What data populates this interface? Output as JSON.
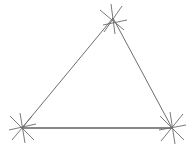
{
  "figure": {
    "type": "geometry-diagram",
    "shape_name": "triangle",
    "width": 196,
    "height": 152,
    "background_color": "#ffffff",
    "colors": {
      "edge_stroke": "#6e6e6e",
      "base_edge_stroke": "#5f5f5f",
      "tick_stroke": "#6a6a6a",
      "background": "#ffffff"
    },
    "stroke_widths": {
      "edge": 1.0,
      "base_edge": 1.5,
      "tick": 0.9
    },
    "vertices": [
      {
        "name": "apex",
        "label": "top-vertex",
        "x": 113,
        "y": 18
      },
      {
        "name": "bottom-left",
        "label": "bottom-left-vertex",
        "x": 22,
        "y": 128
      },
      {
        "name": "bottom-right",
        "label": "bottom-right-vertex",
        "x": 172,
        "y": 128
      }
    ],
    "edges": [
      {
        "name": "left-edge",
        "from": "bottom-left",
        "to": "apex",
        "x1": 22,
        "y1": 128,
        "x2": 113,
        "y2": 18,
        "stroke": "#6e6e6e",
        "width": 1.0
      },
      {
        "name": "right-edge",
        "from": "apex",
        "to": "bottom-right",
        "x1": 113,
        "y1": 18,
        "x2": 172,
        "y2": 128,
        "stroke": "#6e6e6e",
        "width": 1.0
      },
      {
        "name": "base-edge",
        "from": "bottom-left",
        "to": "bottom-right",
        "x1": 22,
        "y1": 128,
        "x2": 172,
        "y2": 128,
        "stroke": "#5f5f5f",
        "width": 1.5
      }
    ],
    "vertex_marks": {
      "apex": [
        {
          "name": "apex-tick-1",
          "x1": 100,
          "y1": 10,
          "x2": 124,
          "y2": 30
        },
        {
          "name": "apex-tick-2",
          "x1": 122,
          "y1": 6,
          "x2": 104,
          "y2": 32
        },
        {
          "name": "apex-tick-3",
          "x1": 103,
          "y1": 25,
          "x2": 127,
          "y2": 20
        },
        {
          "name": "apex-tick-4",
          "x1": 111,
          "y1": 4,
          "x2": 115,
          "y2": 34
        }
      ],
      "bottom-left": [
        {
          "name": "bl-tick-1",
          "x1": 10,
          "y1": 116,
          "x2": 34,
          "y2": 140
        },
        {
          "name": "bl-tick-2",
          "x1": 32,
          "y1": 116,
          "x2": 12,
          "y2": 140
        },
        {
          "name": "bl-tick-3",
          "x1": 9,
          "y1": 130,
          "x2": 36,
          "y2": 124
        },
        {
          "name": "bl-tick-4",
          "x1": 20,
          "y1": 113,
          "x2": 25,
          "y2": 143
        }
      ],
      "bottom-right": [
        {
          "name": "br-tick-1",
          "x1": 160,
          "y1": 116,
          "x2": 184,
          "y2": 140
        },
        {
          "name": "br-tick-2",
          "x1": 183,
          "y1": 114,
          "x2": 161,
          "y2": 141
        },
        {
          "name": "br-tick-3",
          "x1": 159,
          "y1": 130,
          "x2": 186,
          "y2": 125
        },
        {
          "name": "br-tick-4",
          "x1": 170,
          "y1": 112,
          "x2": 175,
          "y2": 144
        }
      ]
    }
  }
}
